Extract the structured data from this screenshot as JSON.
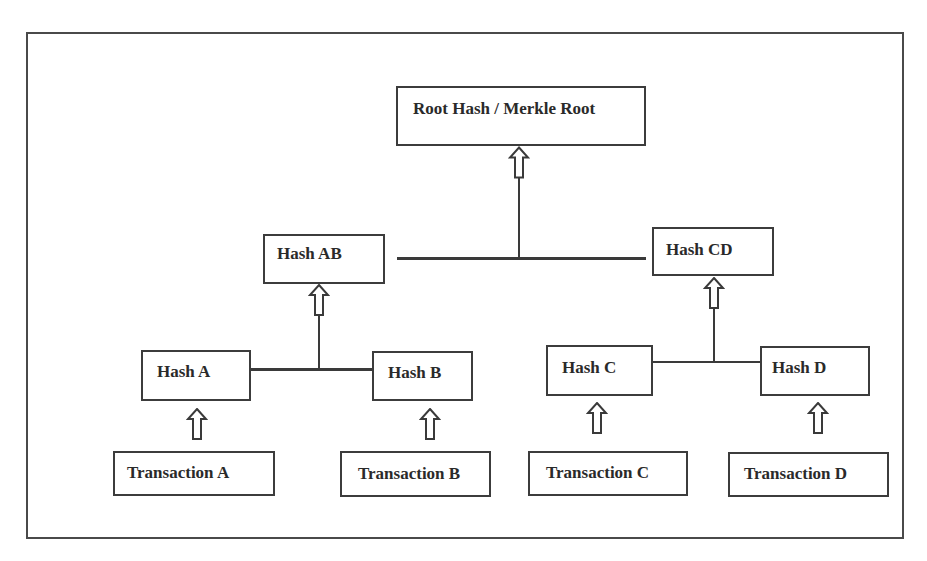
{
  "diagram": {
    "type": "merkle-tree",
    "root": {
      "label": "Root Hash / Merkle Root"
    },
    "level1": [
      {
        "id": "hash-ab",
        "label": "Hash AB"
      },
      {
        "id": "hash-cd",
        "label": "Hash CD"
      }
    ],
    "level2": [
      {
        "id": "hash-a",
        "label": "Hash A"
      },
      {
        "id": "hash-b",
        "label": "Hash B"
      },
      {
        "id": "hash-c",
        "label": "Hash C"
      },
      {
        "id": "hash-d",
        "label": "Hash D"
      }
    ],
    "leaves": [
      {
        "id": "transaction-a",
        "label": "Transaction A"
      },
      {
        "id": "transaction-b",
        "label": "Transaction B"
      },
      {
        "id": "transaction-c",
        "label": "Transaction C"
      },
      {
        "id": "transaction-d",
        "label": "Transaction D"
      }
    ],
    "edges": [
      {
        "from": "Transaction A",
        "to": "Hash A",
        "style": "hollow-up-arrow"
      },
      {
        "from": "Transaction B",
        "to": "Hash B",
        "style": "hollow-up-arrow"
      },
      {
        "from": "Transaction C",
        "to": "Hash C",
        "style": "hollow-up-arrow"
      },
      {
        "from": "Transaction D",
        "to": "Hash D",
        "style": "hollow-up-arrow"
      },
      {
        "from": [
          "Hash A",
          "Hash B"
        ],
        "to": "Hash AB",
        "style": "joined-line-hollow-up-arrow"
      },
      {
        "from": [
          "Hash C",
          "Hash D"
        ],
        "to": "Hash CD",
        "style": "joined-line-hollow-up-arrow"
      },
      {
        "from": [
          "Hash AB",
          "Hash CD"
        ],
        "to": "Root Hash / Merkle Root",
        "style": "joined-line-hollow-up-arrow"
      }
    ],
    "colors": {
      "background": "#ffffff",
      "stroke": "#3c3c3c",
      "text": "#2a2a2a"
    }
  }
}
